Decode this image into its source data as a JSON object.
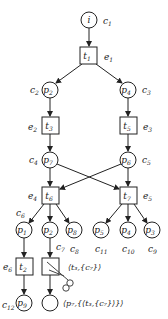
{
  "diagram": {
    "type": "petri-net-unfolding",
    "places": [
      {
        "id": "i",
        "label": "i",
        "sub": "",
        "cond": "c",
        "cond_sub": "1",
        "cx": 89,
        "cy": 20
      },
      {
        "id": "p2a",
        "label": "p",
        "sub": "2",
        "cond": "c",
        "cond_sub": "2",
        "cx": 50,
        "cy": 90
      },
      {
        "id": "p4a",
        "label": "p",
        "sub": "4",
        "cond": "c",
        "cond_sub": "3",
        "cx": 128,
        "cy": 90
      },
      {
        "id": "p7",
        "label": "p",
        "sub": "7",
        "cond": "c",
        "cond_sub": "4",
        "cx": 50,
        "cy": 160
      },
      {
        "id": "p6",
        "label": "p",
        "sub": "6",
        "cond": "c",
        "cond_sub": "5",
        "cx": 128,
        "cy": 160
      },
      {
        "id": "p1",
        "label": "p",
        "sub": "1",
        "cond": "c",
        "cond_sub": "6",
        "cx": 24,
        "cy": 230
      },
      {
        "id": "p2b",
        "label": "p",
        "sub": "2",
        "cond": "c",
        "cond_sub": "7",
        "cx": 50,
        "cy": 230
      },
      {
        "id": "p8",
        "label": "p",
        "sub": "8",
        "cond": "c",
        "cond_sub": "8",
        "cx": 74,
        "cy": 230
      },
      {
        "id": "p5",
        "label": "p",
        "sub": "5",
        "cond": "c",
        "cond_sub": "11",
        "cx": 101,
        "cy": 230
      },
      {
        "id": "p4b",
        "label": "p",
        "sub": "4",
        "cond": "c",
        "cond_sub": "10",
        "cx": 128,
        "cy": 230
      },
      {
        "id": "p3",
        "label": "p",
        "sub": "3",
        "cond": "c",
        "cond_sub": "9",
        "cx": 152,
        "cy": 230
      },
      {
        "id": "p9",
        "label": "p",
        "sub": "9",
        "cond": "c",
        "cond_sub": "12",
        "cx": 24,
        "cy": 303
      },
      {
        "id": "empty",
        "label": "",
        "sub": "",
        "cond": "",
        "cond_sub": "",
        "cx": 50,
        "cy": 303
      }
    ],
    "transitions": [
      {
        "id": "t1",
        "label": "t",
        "sub": "1",
        "event": "e",
        "event_sub": "1",
        "x": 80,
        "y": 47
      },
      {
        "id": "t3",
        "label": "t",
        "sub": "3",
        "event": "e",
        "event_sub": "2",
        "x": 42,
        "y": 117
      },
      {
        "id": "t5",
        "label": "t",
        "sub": "5",
        "event": "e",
        "event_sub": "3",
        "x": 120,
        "y": 117
      },
      {
        "id": "t6",
        "label": "t",
        "sub": "6",
        "event": "e",
        "event_sub": "4",
        "x": 42,
        "y": 187
      },
      {
        "id": "t7",
        "label": "t",
        "sub": "7",
        "event": "e",
        "event_sub": "5",
        "x": 120,
        "y": 187
      },
      {
        "id": "t2",
        "label": "t",
        "sub": "2",
        "event": "e",
        "event_sub": "6",
        "x": 16,
        "y": 258
      },
      {
        "id": "cut",
        "label": "",
        "sub": "",
        "event": "",
        "event_sub": "",
        "x": 42,
        "y": 258
      }
    ],
    "annotations": {
      "cut_event": "⟨t₃,{c₇}⟩",
      "cut_condition": "⟨p₇,{⟨t₃,{c₇}⟩}⟩"
    },
    "scissors_icon": "scissors"
  }
}
